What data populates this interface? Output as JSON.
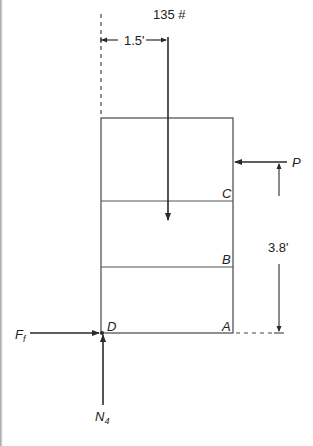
{
  "figure": {
    "type": "free-body-diagram"
  },
  "labels": {
    "load": "135 #",
    "horizontal_offset": "1.5'",
    "height_dim": "3.8'",
    "force_p": "P",
    "friction_force": "F",
    "friction_sub": "f",
    "normal_force": "N",
    "normal_sub": "4",
    "point_a": "A",
    "point_b": "B",
    "point_c": "C",
    "point_d": "D"
  },
  "geometry": {
    "block": {
      "left": 101,
      "right": 233,
      "top": 118,
      "bottom": 333
    },
    "divider_c_y": 201,
    "divider_b_y": 267,
    "load_x": 168,
    "p_y": 162,
    "dim_x": 279
  },
  "colors": {
    "line": "#2a2a2a",
    "block_line": "#555555",
    "text": "#222222",
    "background": "#ffffff"
  }
}
